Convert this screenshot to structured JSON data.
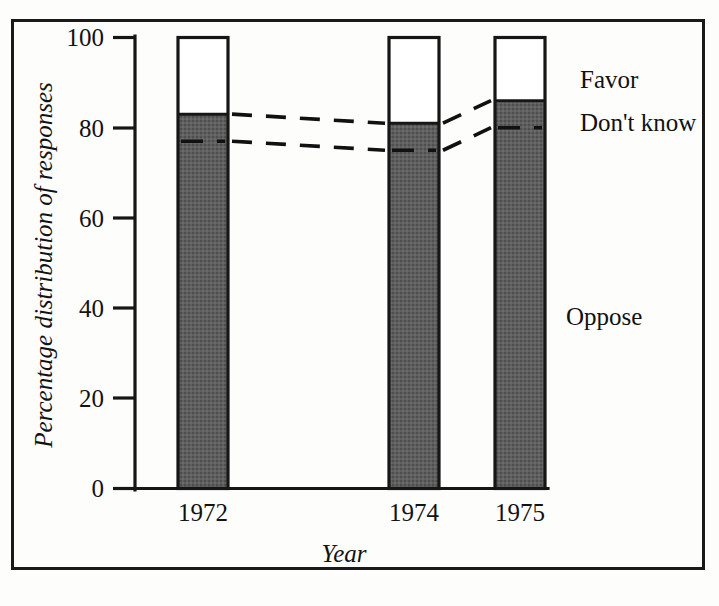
{
  "chart_data": {
    "type": "bar",
    "subtype": "stacked-bar-100",
    "title": "",
    "xlabel": "Year",
    "ylabel": "Percentage distribution of responses",
    "categories": [
      "1972",
      "1974",
      "1975"
    ],
    "ylim": [
      0,
      100
    ],
    "yticks": [
      0,
      20,
      40,
      60,
      80,
      100
    ],
    "ytick_labels": [
      "0",
      "20",
      "40",
      "60",
      "80",
      "100"
    ],
    "grid": false,
    "legend_position": "right-inline",
    "series": [
      {
        "name": "Oppose",
        "values": [
          77,
          75,
          80
        ],
        "color": "#5c5c5c"
      },
      {
        "name": "Don't know",
        "values": [
          6,
          6,
          6
        ],
        "color": "#5c5c5c"
      },
      {
        "name": "Favor",
        "values": [
          17,
          19,
          14
        ],
        "color": "#ffffff"
      }
    ],
    "segment_boundaries": {
      "oppose_top": [
        77,
        75,
        80
      ],
      "dontknow_top": [
        83,
        81,
        86
      ]
    },
    "annotations": [
      {
        "text": "Favor",
        "x": 580,
        "y": 80
      },
      {
        "text": "Don't know",
        "x": 580,
        "y": 122
      },
      {
        "text": "Oppose",
        "x": 566,
        "y": 316
      }
    ],
    "colors": {
      "fill_oppose": "#5c5c5c",
      "fill_favor": "#ffffff",
      "stroke": "#161616",
      "background": "#fdfdfc"
    }
  },
  "labels": {
    "y_axis_title": "Percentage distribution of responses",
    "x_axis_title": "Year",
    "legend_favor": "Favor",
    "legend_dontknow": "Don't know",
    "legend_oppose": "Oppose",
    "ytick_100": "100",
    "ytick_80": "80",
    "ytick_60": "60",
    "ytick_40": "40",
    "ytick_20": "20",
    "ytick_0": "0",
    "cat_1972": "1972",
    "cat_1974": "1974",
    "cat_1975": "1975"
  }
}
